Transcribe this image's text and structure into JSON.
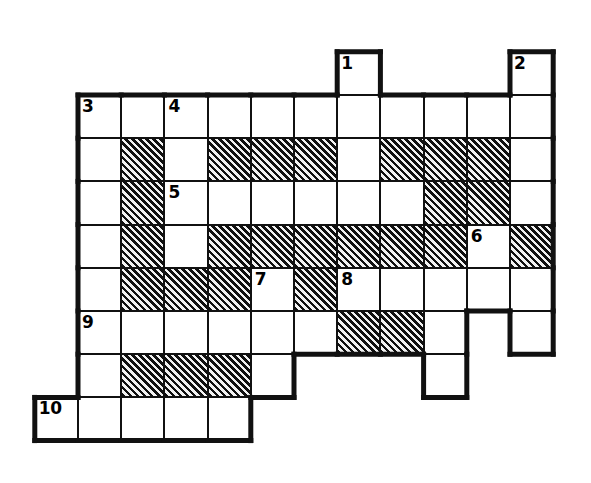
{
  "puzzle": {
    "title": "Crossword Puzzle Grid",
    "kind": "blank-crossword-grid",
    "columns": 11,
    "rows": 9,
    "origin_x": 78,
    "origin_y": 95,
    "cell_size": 43.2,
    "colors": {
      "grid_line": "#111111",
      "cell_background": "#ffffff",
      "filled_hatch_dark": "#101010",
      "filled_hatch_light": "#f2f2f2",
      "number_text": "#000000",
      "page_background": "#ffffff"
    },
    "legend": {
      "white_cell": "open letter square",
      "hatched_cell": "blocked square"
    },
    "clue_numbers": [
      {
        "label": "1",
        "col": 6,
        "row": -1
      },
      {
        "label": "2",
        "col": 10,
        "row": -1
      },
      {
        "label": "3",
        "col": 0,
        "row": 0
      },
      {
        "label": "4",
        "col": 2,
        "row": 0
      },
      {
        "label": "5",
        "col": 2,
        "row": 2
      },
      {
        "label": "6",
        "col": 9,
        "row": 3
      },
      {
        "label": "7",
        "col": 4,
        "row": 4
      },
      {
        "label": "8",
        "col": 6,
        "row": 4
      },
      {
        "label": "9",
        "col": 0,
        "row": 5
      },
      {
        "label": "10",
        "col": -1,
        "row": 7
      }
    ],
    "cells": [
      {
        "col": 6,
        "row": -1,
        "state": "white",
        "number": "1"
      },
      {
        "col": 10,
        "row": -1,
        "state": "white",
        "number": "2"
      },
      {
        "col": 0,
        "row": 0,
        "state": "white",
        "number": "3"
      },
      {
        "col": 1,
        "row": 0,
        "state": "white",
        "number": ""
      },
      {
        "col": 2,
        "row": 0,
        "state": "white",
        "number": "4"
      },
      {
        "col": 3,
        "row": 0,
        "state": "white",
        "number": ""
      },
      {
        "col": 4,
        "row": 0,
        "state": "white",
        "number": ""
      },
      {
        "col": 5,
        "row": 0,
        "state": "white",
        "number": ""
      },
      {
        "col": 6,
        "row": 0,
        "state": "white",
        "number": ""
      },
      {
        "col": 7,
        "row": 0,
        "state": "white",
        "number": ""
      },
      {
        "col": 8,
        "row": 0,
        "state": "white",
        "number": ""
      },
      {
        "col": 9,
        "row": 0,
        "state": "white",
        "number": ""
      },
      {
        "col": 10,
        "row": 0,
        "state": "white",
        "number": ""
      },
      {
        "col": 0,
        "row": 1,
        "state": "white",
        "number": ""
      },
      {
        "col": 1,
        "row": 1,
        "state": "filled",
        "number": ""
      },
      {
        "col": 2,
        "row": 1,
        "state": "white",
        "number": ""
      },
      {
        "col": 3,
        "row": 1,
        "state": "filled",
        "number": ""
      },
      {
        "col": 4,
        "row": 1,
        "state": "filled",
        "number": ""
      },
      {
        "col": 5,
        "row": 1,
        "state": "filled",
        "number": ""
      },
      {
        "col": 6,
        "row": 1,
        "state": "white",
        "number": ""
      },
      {
        "col": 7,
        "row": 1,
        "state": "filled",
        "number": ""
      },
      {
        "col": 8,
        "row": 1,
        "state": "filled",
        "number": ""
      },
      {
        "col": 9,
        "row": 1,
        "state": "filled",
        "number": ""
      },
      {
        "col": 10,
        "row": 1,
        "state": "white",
        "number": ""
      },
      {
        "col": 0,
        "row": 2,
        "state": "white",
        "number": ""
      },
      {
        "col": 1,
        "row": 2,
        "state": "filled",
        "number": ""
      },
      {
        "col": 2,
        "row": 2,
        "state": "white",
        "number": "5"
      },
      {
        "col": 3,
        "row": 2,
        "state": "white",
        "number": ""
      },
      {
        "col": 4,
        "row": 2,
        "state": "white",
        "number": ""
      },
      {
        "col": 5,
        "row": 2,
        "state": "white",
        "number": ""
      },
      {
        "col": 6,
        "row": 2,
        "state": "white",
        "number": ""
      },
      {
        "col": 7,
        "row": 2,
        "state": "white",
        "number": ""
      },
      {
        "col": 8,
        "row": 2,
        "state": "filled",
        "number": ""
      },
      {
        "col": 9,
        "row": 2,
        "state": "filled",
        "number": ""
      },
      {
        "col": 10,
        "row": 2,
        "state": "white",
        "number": ""
      },
      {
        "col": 0,
        "row": 3,
        "state": "white",
        "number": ""
      },
      {
        "col": 1,
        "row": 3,
        "state": "filled",
        "number": ""
      },
      {
        "col": 2,
        "row": 3,
        "state": "white",
        "number": ""
      },
      {
        "col": 3,
        "row": 3,
        "state": "filled",
        "number": ""
      },
      {
        "col": 4,
        "row": 3,
        "state": "filled",
        "number": ""
      },
      {
        "col": 5,
        "row": 3,
        "state": "filled",
        "number": ""
      },
      {
        "col": 6,
        "row": 3,
        "state": "filled",
        "number": ""
      },
      {
        "col": 7,
        "row": 3,
        "state": "filled",
        "number": ""
      },
      {
        "col": 8,
        "row": 3,
        "state": "filled",
        "number": ""
      },
      {
        "col": 9,
        "row": 3,
        "state": "white",
        "number": "6"
      },
      {
        "col": 10,
        "row": 3,
        "state": "filled",
        "number": ""
      },
      {
        "col": 11,
        "row": 3,
        "state": "none",
        "number": ""
      },
      {
        "col": 0,
        "row": 4,
        "state": "white",
        "number": ""
      },
      {
        "col": 1,
        "row": 4,
        "state": "filled",
        "number": ""
      },
      {
        "col": 2,
        "row": 4,
        "state": "filled",
        "number": ""
      },
      {
        "col": 3,
        "row": 4,
        "state": "filled",
        "number": ""
      },
      {
        "col": 4,
        "row": 4,
        "state": "white",
        "number": "7"
      },
      {
        "col": 5,
        "row": 4,
        "state": "filled",
        "number": ""
      },
      {
        "col": 6,
        "row": 4,
        "state": "white",
        "number": "8"
      },
      {
        "col": 7,
        "row": 4,
        "state": "white",
        "number": ""
      },
      {
        "col": 8,
        "row": 4,
        "state": "white",
        "number": ""
      },
      {
        "col": 9,
        "row": 4,
        "state": "white",
        "number": ""
      },
      {
        "col": 10,
        "row": 4,
        "state": "white",
        "number": ""
      },
      {
        "col": 0,
        "row": 5,
        "state": "white",
        "number": "9"
      },
      {
        "col": 1,
        "row": 5,
        "state": "white",
        "number": ""
      },
      {
        "col": 2,
        "row": 5,
        "state": "white",
        "number": ""
      },
      {
        "col": 3,
        "row": 5,
        "state": "white",
        "number": ""
      },
      {
        "col": 4,
        "row": 5,
        "state": "white",
        "number": ""
      },
      {
        "col": 5,
        "row": 5,
        "state": "white",
        "number": ""
      },
      {
        "col": 6,
        "row": 5,
        "state": "filled",
        "number": ""
      },
      {
        "col": 7,
        "row": 5,
        "state": "filled",
        "number": ""
      },
      {
        "col": 8,
        "row": 5,
        "state": "white",
        "number": ""
      },
      {
        "col": 10,
        "row": 5,
        "state": "white",
        "number": ""
      },
      {
        "col": 0,
        "row": 6,
        "state": "white",
        "number": ""
      },
      {
        "col": 1,
        "row": 6,
        "state": "filled",
        "number": ""
      },
      {
        "col": 2,
        "row": 6,
        "state": "filled",
        "number": ""
      },
      {
        "col": 3,
        "row": 6,
        "state": "filled",
        "number": ""
      },
      {
        "col": 4,
        "row": 6,
        "state": "white",
        "number": ""
      },
      {
        "col": 8,
        "row": 6,
        "state": "white",
        "number": ""
      },
      {
        "col": -1,
        "row": 7,
        "state": "white",
        "number": "10"
      },
      {
        "col": 0,
        "row": 7,
        "state": "white",
        "number": ""
      },
      {
        "col": 1,
        "row": 7,
        "state": "white",
        "number": ""
      },
      {
        "col": 2,
        "row": 7,
        "state": "white",
        "number": ""
      },
      {
        "col": 3,
        "row": 7,
        "state": "white",
        "number": ""
      }
    ]
  }
}
